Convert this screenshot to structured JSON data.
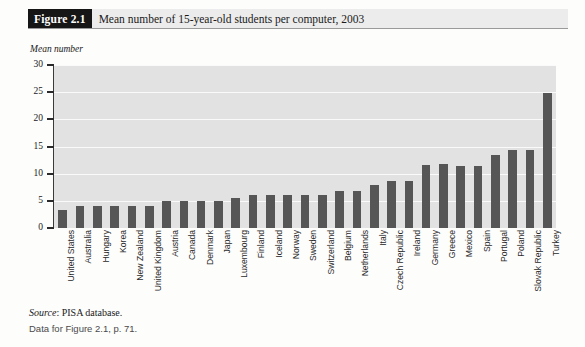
{
  "figure": {
    "tag": "Figure 2.1",
    "title": "Mean number of 15-year-old students per computer, 2003"
  },
  "footer": {
    "source_word": "Source",
    "source_rest": ": PISA database.",
    "data_note": "Data for Figure 2.1, p. 71."
  },
  "colors": {
    "bar": "#565656",
    "plot_background": "#e2e2e2",
    "gridline": "#fafafa",
    "tag_background": "#161616",
    "title_background": "#ececec"
  },
  "chart_data": {
    "type": "bar",
    "title": "Mean number of 15-year-old students per computer, 2003",
    "xlabel": "",
    "ylabel": "Mean number",
    "ylim": [
      0,
      30
    ],
    "yticks": [
      0,
      5,
      10,
      15,
      20,
      25,
      30
    ],
    "grid": true,
    "legend": "none",
    "orientation": "vertical",
    "categories": [
      "United States",
      "Australia",
      "Hungary",
      "Korea",
      "New Zealand",
      "United Kingdom",
      "Austria",
      "Canada",
      "Denmark",
      "Japan",
      "Luxembourg",
      "Finland",
      "Iceland",
      "Norway",
      "Sweden",
      "Switzerland",
      "Belgium",
      "Netherlands",
      "Italy",
      "Czech Republic",
      "Ireland",
      "Germany",
      "Greece",
      "Mexico",
      "Spain",
      "Portugal",
      "Poland",
      "Slovak Republic",
      "Turkey"
    ],
    "values": [
      3.3,
      4.1,
      4.0,
      4.0,
      4.1,
      4.0,
      5.0,
      5.0,
      5.0,
      5.0,
      5.6,
      6.1,
      6.1,
      6.1,
      6.1,
      6.1,
      6.8,
      6.8,
      8.0,
      8.6,
      8.6,
      11.6,
      11.8,
      11.4,
      11.4,
      13.5,
      14.4,
      14.4,
      24.8
    ]
  }
}
